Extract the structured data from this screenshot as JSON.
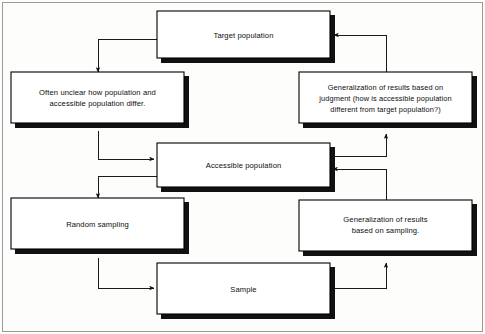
{
  "diagram": {
    "background_color": "#fdfdfc",
    "box_fill_color": "#ffffff",
    "box_border_color": "#000000",
    "shadow_color": "#111111",
    "connector_color": "#1a1a1a",
    "nodes": [
      {
        "id": "target-population",
        "lines": [
          "Target population"
        ]
      },
      {
        "id": "often-unclear",
        "lines": [
          "Often unclear how population and",
          "accessible population differ."
        ]
      },
      {
        "id": "generalization-judgment",
        "lines": [
          "Generalization of results based on",
          "judgment (how is accessible population",
          "different from target population?)"
        ]
      },
      {
        "id": "accessible-population",
        "lines": [
          "Accessible population"
        ]
      },
      {
        "id": "random-sampling",
        "lines": [
          "Random sampling"
        ]
      },
      {
        "id": "generalization-sampling",
        "lines": [
          "Generalization of results",
          "based on sampling."
        ]
      },
      {
        "id": "sample",
        "lines": [
          "Sample"
        ]
      }
    ],
    "edges": [
      {
        "id": "target-to-often-unclear",
        "from": "target-population",
        "to": "often-unclear"
      },
      {
        "id": "often-unclear-to-accessible",
        "from": "often-unclear",
        "to": "accessible-population"
      },
      {
        "id": "accessible-to-random-sampling",
        "from": "accessible-population",
        "to": "random-sampling"
      },
      {
        "id": "random-sampling-to-sample",
        "from": "random-sampling",
        "to": "sample"
      },
      {
        "id": "sample-to-generalization-sampling",
        "from": "sample",
        "to": "generalization-sampling"
      },
      {
        "id": "generalization-sampling-to-accessible",
        "from": "generalization-sampling",
        "to": "accessible-population"
      },
      {
        "id": "accessible-to-generalization-judgment",
        "from": "accessible-population",
        "to": "generalization-judgment"
      },
      {
        "id": "generalization-judgment-to-target",
        "from": "generalization-judgment",
        "to": "target-population"
      }
    ]
  }
}
